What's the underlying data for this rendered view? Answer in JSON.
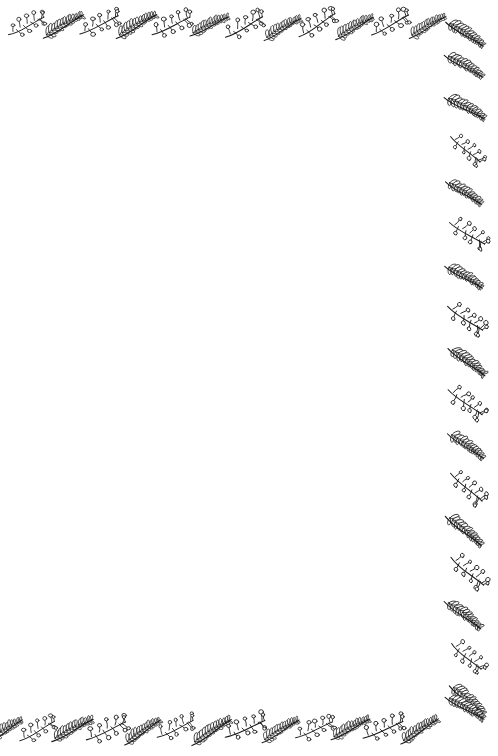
{
  "page": {
    "width": 498,
    "height": 756,
    "background_color": "#ffffff",
    "ink_color": "#1a1a1a",
    "content_text": ""
  },
  "motifs": {
    "berry": {
      "name": "berry-sprig",
      "description": "Curved stem with short alternating side stalks, each ending in a small open circle"
    },
    "feather": {
      "name": "feather-sprig",
      "description": "Curved stem with dense elongated loop-shaped leaflets angled along both sides"
    }
  },
  "borders": {
    "top": {
      "name": "top-border",
      "present": true,
      "motif_count": 12,
      "sequence": [
        "berry",
        "feather",
        "berry",
        "feather",
        "berry",
        "feather",
        "berry",
        "feather",
        "berry",
        "feather",
        "berry",
        "feather"
      ]
    },
    "right": {
      "name": "right-border",
      "present": true,
      "motif_count": 16,
      "sequence": [
        "feather",
        "feather",
        "berry",
        "feather",
        "berry",
        "feather",
        "berry",
        "feather",
        "berry",
        "feather",
        "berry",
        "feather",
        "berry",
        "feather",
        "berry",
        "feather"
      ]
    },
    "bottom": {
      "name": "bottom-border",
      "present": true,
      "motif_count": 13,
      "sequence": [
        "feather",
        "berry",
        "feather",
        "berry",
        "feather",
        "berry",
        "feather",
        "berry",
        "feather",
        "berry",
        "feather",
        "berry",
        "feather"
      ]
    },
    "left": {
      "name": "left-border",
      "present": false,
      "motif_count": 0,
      "sequence": []
    }
  }
}
